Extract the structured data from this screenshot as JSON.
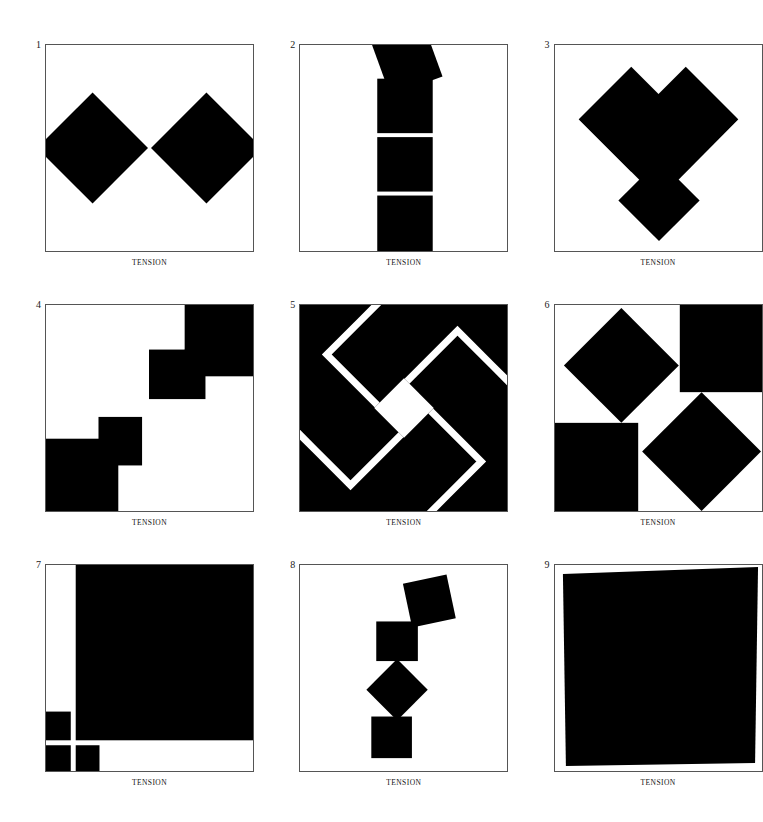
{
  "page": {
    "background_color": "#ffffff",
    "ink_color": "#000000",
    "frame_color": "#555555",
    "columns": 3,
    "rows": 3
  },
  "panels": [
    {
      "number": "1",
      "caption": "TENSION",
      "inverted": false,
      "description": "Two large diamonds meeting point-to-point at center, their outer points cropped by the left and right frame edges",
      "shape_count": 2,
      "shapes": [
        {
          "name": "diamond-left",
          "type": "diamond",
          "cx": 47,
          "cy": 104,
          "r": 56,
          "clipped": true
        },
        {
          "name": "diamond-right",
          "type": "diamond",
          "cx": 162,
          "cy": 104,
          "r": 56,
          "clipped": true
        }
      ]
    },
    {
      "number": "2",
      "caption": "TENSION",
      "inverted": false,
      "description": "A vertical stack of three squares rising from the bottom edge with a tilted square balanced on top",
      "shape_count": 4,
      "shapes": [
        {
          "name": "square-bottom",
          "type": "square",
          "x": 78,
          "y": 152,
          "size": 56,
          "rotation": 0
        },
        {
          "name": "square-middle",
          "type": "square",
          "x": 78,
          "y": 93,
          "size": 56,
          "rotation": 0
        },
        {
          "name": "square-upper",
          "type": "square",
          "x": 78,
          "y": 34,
          "size": 56,
          "rotation": 0
        },
        {
          "name": "square-tilted-top",
          "type": "square",
          "x": 80,
          "y": -22,
          "size": 56,
          "rotation": -20
        }
      ]
    },
    {
      "number": "3",
      "caption": "TENSION",
      "inverted": false,
      "description": "Two overlapping diamonds forming a V or heart at the top, with a third diamond below touching at a single point",
      "shape_count": 3,
      "shapes": [
        {
          "name": "diamond-upper-left",
          "type": "diamond",
          "cx": 77,
          "cy": 75,
          "r": 53
        },
        {
          "name": "diamond-upper-right",
          "type": "diamond",
          "cx": 132,
          "cy": 75,
          "r": 53
        },
        {
          "name": "diamond-lower",
          "type": "diamond",
          "cx": 105,
          "cy": 155,
          "r": 41
        }
      ]
    },
    {
      "number": "4",
      "caption": "TENSION",
      "inverted": false,
      "description": "Two staircase blocks in opposite corners: a rectangle plus offset square at top right and the mirrored pair at bottom left",
      "shape_count": 4,
      "shapes": [
        {
          "name": "rect-top-right",
          "type": "rect",
          "x": 140,
          "y": 0,
          "w": 69,
          "h": 71
        },
        {
          "name": "square-top-inner",
          "type": "rect",
          "x": 104,
          "y": 45,
          "w": 44,
          "h": 50
        },
        {
          "name": "rect-bottom-left",
          "type": "rect",
          "x": 0,
          "y": 135,
          "w": 73,
          "h": 73
        },
        {
          "name": "square-bottom-inner",
          "type": "rect",
          "x": 53,
          "y": 113,
          "w": 44,
          "h": 49
        }
      ]
    },
    {
      "number": "5",
      "caption": "TENSION",
      "inverted": true,
      "description": "Inverted field: a solid black square holding a white diamond at center with four white chevron strokes pinwheeling outward to the edges",
      "shape_count": 5,
      "shapes": [
        {
          "name": "diamond-center-white",
          "type": "diamond",
          "cx": 105,
          "cy": 104,
          "r": 30
        },
        {
          "name": "chevron-arm-upper",
          "type": "polyline-stroke",
          "stroke_width": 7
        },
        {
          "name": "chevron-arm-right",
          "type": "polyline-stroke",
          "stroke_width": 7
        },
        {
          "name": "chevron-arm-lower",
          "type": "polyline-stroke",
          "stroke_width": 7
        },
        {
          "name": "chevron-arm-left",
          "type": "polyline-stroke",
          "stroke_width": 7
        }
      ]
    },
    {
      "number": "6",
      "caption": "TENSION",
      "inverted": false,
      "description": "Four shapes in a pinwheel: diamond top left, square flush to top right corner, square flush to bottom left corner, diamond bottom right",
      "shape_count": 4,
      "shapes": [
        {
          "name": "diamond-top-left",
          "type": "diamond",
          "cx": 67,
          "cy": 62,
          "r": 58
        },
        {
          "name": "square-top-right",
          "type": "rect",
          "x": 126,
          "y": 0,
          "w": 83,
          "h": 88
        },
        {
          "name": "square-bottom-left",
          "type": "rect",
          "x": 0,
          "y": 119,
          "w": 84,
          "h": 89
        },
        {
          "name": "diamond-bottom-right",
          "type": "diamond",
          "cx": 148,
          "cy": 148,
          "r": 60
        }
      ]
    },
    {
      "number": "7",
      "caption": "TENSION",
      "inverted": false,
      "description": "One dominant black square filling the top right, balanced by three small squares clustered at the lower left corner",
      "shape_count": 4,
      "shapes": [
        {
          "name": "square-large",
          "type": "rect",
          "x": 30,
          "y": 0,
          "w": 179,
          "h": 177
        },
        {
          "name": "square-small-upper-left",
          "type": "rect",
          "x": 0,
          "y": 148,
          "w": 25,
          "h": 29
        },
        {
          "name": "square-small-bottom-left",
          "type": "rect",
          "x": 0,
          "y": 182,
          "w": 25,
          "h": 26
        },
        {
          "name": "square-small-bottom-right",
          "type": "rect",
          "x": 30,
          "y": 182,
          "w": 24,
          "h": 26
        }
      ]
    },
    {
      "number": "8",
      "caption": "TENSION",
      "inverted": false,
      "description": "A teetering vertical chain of four squares: tilted square, upright square, diamond, upright square, each touching the next",
      "shape_count": 4,
      "shapes": [
        {
          "name": "square-tilted-top",
          "type": "square",
          "x": 108,
          "y": 14,
          "size": 45,
          "rotation": -12
        },
        {
          "name": "square-second",
          "type": "rect",
          "x": 77,
          "y": 57,
          "w": 42,
          "h": 40
        },
        {
          "name": "diamond-third",
          "type": "diamond",
          "cx": 98,
          "cy": 126,
          "r": 31
        },
        {
          "name": "square-bottom",
          "type": "rect",
          "x": 72,
          "y": 153,
          "w": 41,
          "h": 42
        }
      ]
    },
    {
      "number": "9",
      "caption": "TENSION",
      "inverted": false,
      "description": "A single massive black square rotated a couple of degrees, nearly filling and pressing against the frame",
      "shape_count": 1,
      "shapes": [
        {
          "name": "square-rotated-large",
          "type": "square",
          "x": 10,
          "y": 6,
          "size": 192,
          "rotation": -1.6
        }
      ]
    }
  ]
}
